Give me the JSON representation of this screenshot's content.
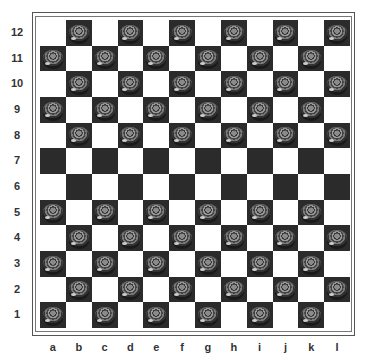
{
  "board": {
    "size": 12,
    "files": [
      "a",
      "b",
      "c",
      "d",
      "e",
      "f",
      "g",
      "h",
      "i",
      "j",
      "k",
      "l"
    ],
    "ranks": [
      "12",
      "11",
      "10",
      "9",
      "8",
      "7",
      "6",
      "5",
      "4",
      "3",
      "2",
      "1"
    ],
    "colors": {
      "light": "#ffffff",
      "dark": "#2b2b2b",
      "frame": "#555555"
    },
    "top_left_square": "light",
    "pieces_on_dark_squares_rows": [
      "12",
      "11",
      "10",
      "9",
      "8",
      "5",
      "4",
      "3",
      "2",
      "1"
    ],
    "empty_rows": [
      "7",
      "6"
    ],
    "piece_color": "gray"
  }
}
